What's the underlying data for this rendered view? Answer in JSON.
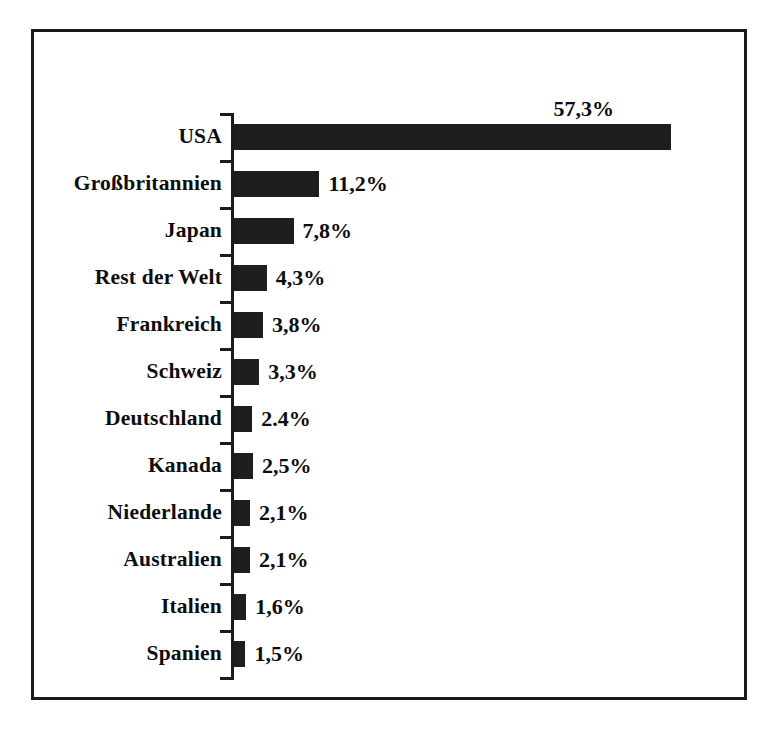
{
  "chart_data": {
    "type": "bar",
    "orientation": "horizontal",
    "title": "",
    "subtitle": "",
    "xlabel": "",
    "ylabel": "",
    "grid": false,
    "legend": null,
    "axis_line": true,
    "value_suffix": "%",
    "xlim": [
      0,
      57.3
    ],
    "categories": [
      "USA",
      "Großbritannien",
      "Japan",
      "Rest der Welt",
      "Frankreich",
      "Schweiz",
      "Deutschland",
      "Kanada",
      "Niederlande",
      "Australien",
      "Italien",
      "Spanien"
    ],
    "values": [
      57.3,
      11.2,
      7.8,
      4.3,
      3.8,
      3.3,
      2.4,
      2.5,
      2.1,
      2.1,
      1.6,
      1.5
    ],
    "data_labels": [
      "57,3%",
      "11,2%",
      "7,8%",
      "4,3%",
      "3,8%",
      "3,3%",
      "2.4%",
      "2,5%",
      "2,1%",
      "2,1%",
      "1,6%",
      "1,5%"
    ],
    "label_placement": [
      "above",
      "right",
      "right",
      "right",
      "right",
      "right",
      "right",
      "right",
      "right",
      "right",
      "right",
      "right"
    ],
    "bar_color": "#1e1e1e",
    "frame_color": "#1b1b1b",
    "background_color": "#ffffff"
  }
}
